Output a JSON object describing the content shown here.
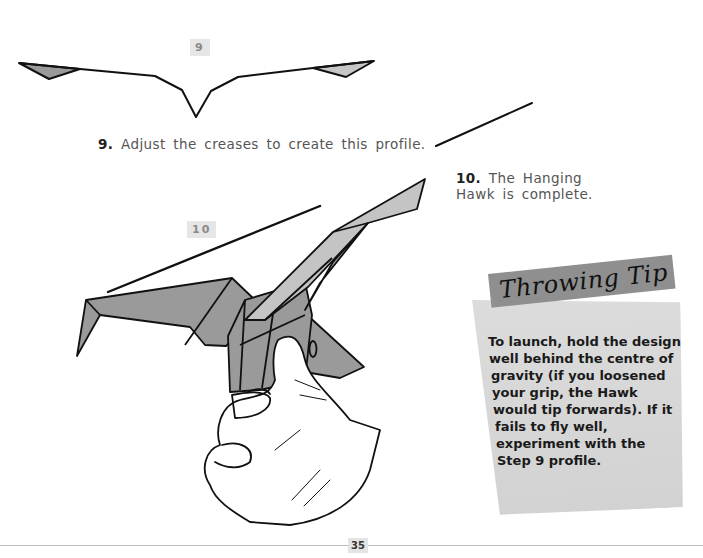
{
  "steps": [
    {
      "badge": "9",
      "number": "9.",
      "caption": "Adjust the creases to create this profile."
    },
    {
      "badge": "10",
      "number": "10.",
      "caption_lines": [
        "The Hanging",
        "Hawk is complete."
      ]
    }
  ],
  "tip": {
    "title": "Throwing Tip",
    "lines": [
      "To launch, hold the design",
      "well behind the centre of",
      "gravity (if you loosened",
      "your grip, the Hawk",
      "would tip forwards). If it",
      "fails to fly well,",
      "experiment with the",
      "Step 9 profile."
    ]
  },
  "footer": {
    "page_number": "35"
  },
  "colors": {
    "paper_fill": "#9a9a9a",
    "paper_light": "#c4c4c4",
    "tip_header": "#8f8f8f",
    "tip_panel": "#d6d6d6"
  }
}
